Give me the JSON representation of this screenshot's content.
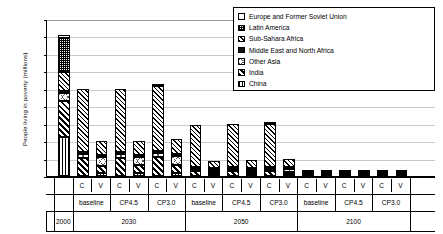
{
  "chart_data": {
    "type": "bar",
    "title": "",
    "subtitle": "",
    "xlabel": "",
    "ylabel": "People living in poverty (millions)",
    "ylim": [
      0,
      1800
    ],
    "ytick_step": 200,
    "yticks": [
      0,
      200,
      400,
      600,
      800,
      1000,
      1200,
      1400,
      1600,
      1800
    ],
    "grid": true,
    "stacked": true,
    "legend_position": "top-right",
    "legend": [
      "Europe and Former Soviet Union",
      "Latin America",
      "Sub-Sahara Africa",
      "Middle East and North Africa",
      "Other Asia",
      "India",
      "China"
    ],
    "series_order_bottom_to_top": [
      "China",
      "India",
      "Other Asia",
      "Middle East and North Africa",
      "Sub-Sahara Africa",
      "Latin America",
      "Europe and Former Soviet Union"
    ],
    "year_groups": [
      {
        "year": "2000",
        "scenarios": [
          {
            "name": "",
            "measures": [
              {
                "label": "",
                "total": 1620
              }
            ]
          }
        ]
      },
      {
        "year": "2030",
        "scenarios": [
          {
            "name": "baseline",
            "measures": [
              {
                "label": "C",
                "total": 1000
              },
              {
                "label": "V",
                "total": 400
              }
            ]
          },
          {
            "name": "CP4.5",
            "measures": [
              {
                "label": "C",
                "total": 1000
              },
              {
                "label": "V",
                "total": 405
              }
            ]
          },
          {
            "name": "CP3.0",
            "measures": [
              {
                "label": "C",
                "total": 1060
              },
              {
                "label": "V",
                "total": 420
              }
            ]
          }
        ]
      },
      {
        "year": "2050",
        "scenarios": [
          {
            "name": "baseline",
            "measures": [
              {
                "label": "C",
                "total": 590
              },
              {
                "label": "V",
                "total": 175
              }
            ]
          },
          {
            "name": "CP4.5",
            "measures": [
              {
                "label": "C",
                "total": 600
              },
              {
                "label": "V",
                "total": 180
              }
            ]
          },
          {
            "name": "CP3.0",
            "measures": [
              {
                "label": "C",
                "total": 625
              },
              {
                "label": "V",
                "total": 190
              }
            ]
          }
        ]
      },
      {
        "year": "2100",
        "scenarios": [
          {
            "name": "baseline",
            "measures": [
              {
                "label": "C",
                "total": 12
              },
              {
                "label": "V",
                "total": 58
              }
            ]
          },
          {
            "name": "CP4.5",
            "measures": [
              {
                "label": "C",
                "total": 12
              },
              {
                "label": "V",
                "total": 58
              }
            ]
          },
          {
            "name": "CP3.0",
            "measures": [
              {
                "label": "C",
                "total": 14
              },
              {
                "label": "V",
                "total": 60
              }
            ]
          }
        ]
      },
      {
        "year": "",
        "scenarios": []
      }
    ],
    "bars": [
      {
        "group": "2000",
        "scenario": "",
        "measure": "",
        "segments": [
          {
            "name": "China",
            "value": 450
          },
          {
            "name": "India",
            "value": 420
          },
          {
            "name": "Other Asia",
            "value": 95
          },
          {
            "name": "Middle East and North Africa",
            "value": 10
          },
          {
            "name": "Sub-Sahara Africa",
            "value": 215
          },
          {
            "name": "Latin America",
            "value": 390
          },
          {
            "name": "Europe and Former Soviet Union",
            "value": 40
          }
        ],
        "total": 1620
      },
      {
        "group": "2030",
        "scenario": "baseline",
        "measure": "C",
        "segments": [
          {
            "name": "China",
            "value": 0
          },
          {
            "name": "India",
            "value": 210
          },
          {
            "name": "Other Asia",
            "value": 45
          },
          {
            "name": "Middle East and North Africa",
            "value": 5
          },
          {
            "name": "Sub-Sahara Africa",
            "value": 740
          },
          {
            "name": "Latin America",
            "value": 0
          },
          {
            "name": "Europe and Former Soviet Union",
            "value": 0
          }
        ],
        "total": 1000
      },
      {
        "group": "2030",
        "scenario": "baseline",
        "measure": "V",
        "segments": [
          {
            "name": "China",
            "value": 35
          },
          {
            "name": "India",
            "value": 90
          },
          {
            "name": "Other Asia",
            "value": 100
          },
          {
            "name": "Middle East and North Africa",
            "value": 5
          },
          {
            "name": "Sub-Sahara Africa",
            "value": 170
          },
          {
            "name": "Latin America",
            "value": 0
          },
          {
            "name": "Europe and Former Soviet Union",
            "value": 0
          }
        ],
        "total": 400
      },
      {
        "group": "2030",
        "scenario": "CP4.5",
        "measure": "C",
        "segments": [
          {
            "name": "China",
            "value": 0
          },
          {
            "name": "India",
            "value": 210
          },
          {
            "name": "Other Asia",
            "value": 45
          },
          {
            "name": "Middle East and North Africa",
            "value": 5
          },
          {
            "name": "Sub-Sahara Africa",
            "value": 740
          },
          {
            "name": "Latin America",
            "value": 0
          },
          {
            "name": "Europe and Former Soviet Union",
            "value": 0
          }
        ],
        "total": 1000
      },
      {
        "group": "2030",
        "scenario": "CP4.5",
        "measure": "V",
        "segments": [
          {
            "name": "China",
            "value": 35
          },
          {
            "name": "India",
            "value": 92
          },
          {
            "name": "Other Asia",
            "value": 100
          },
          {
            "name": "Middle East and North Africa",
            "value": 5
          },
          {
            "name": "Sub-Sahara Africa",
            "value": 173
          },
          {
            "name": "Latin America",
            "value": 0
          },
          {
            "name": "Europe and Former Soviet Union",
            "value": 0
          }
        ],
        "total": 405
      },
      {
        "group": "2030",
        "scenario": "CP3.0",
        "measure": "C",
        "segments": [
          {
            "name": "China",
            "value": 0
          },
          {
            "name": "India",
            "value": 220
          },
          {
            "name": "Other Asia",
            "value": 48
          },
          {
            "name": "Middle East and North Africa",
            "value": 5
          },
          {
            "name": "Sub-Sahara Africa",
            "value": 757
          },
          {
            "name": "Latin America",
            "value": 30
          },
          {
            "name": "Europe and Former Soviet Union",
            "value": 0
          }
        ],
        "total": 1060
      },
      {
        "group": "2030",
        "scenario": "CP3.0",
        "measure": "V",
        "segments": [
          {
            "name": "China",
            "value": 38
          },
          {
            "name": "India",
            "value": 95
          },
          {
            "name": "Other Asia",
            "value": 105
          },
          {
            "name": "Middle East and North Africa",
            "value": 5
          },
          {
            "name": "Sub-Sahara Africa",
            "value": 177
          },
          {
            "name": "Latin America",
            "value": 0
          },
          {
            "name": "Europe and Former Soviet Union",
            "value": 0
          }
        ],
        "total": 420
      },
      {
        "group": "2050",
        "scenario": "baseline",
        "measure": "C",
        "segments": [
          {
            "name": "China",
            "value": 0
          },
          {
            "name": "India",
            "value": 60
          },
          {
            "name": "Other Asia",
            "value": 20
          },
          {
            "name": "Middle East and North Africa",
            "value": 3
          },
          {
            "name": "Sub-Sahara Africa",
            "value": 507
          },
          {
            "name": "Latin America",
            "value": 0
          },
          {
            "name": "Europe and Former Soviet Union",
            "value": 0
          }
        ],
        "total": 590
      },
      {
        "group": "2050",
        "scenario": "baseline",
        "measure": "V",
        "segments": [
          {
            "name": "China",
            "value": 8
          },
          {
            "name": "India",
            "value": 22
          },
          {
            "name": "Other Asia",
            "value": 30
          },
          {
            "name": "Middle East and North Africa",
            "value": 3
          },
          {
            "name": "Sub-Sahara Africa",
            "value": 112
          },
          {
            "name": "Latin America",
            "value": 0
          },
          {
            "name": "Europe and Former Soviet Union",
            "value": 0
          }
        ],
        "total": 175
      },
      {
        "group": "2050",
        "scenario": "CP4.5",
        "measure": "C",
        "segments": [
          {
            "name": "China",
            "value": 0
          },
          {
            "name": "India",
            "value": 62
          },
          {
            "name": "Other Asia",
            "value": 20
          },
          {
            "name": "Middle East and North Africa",
            "value": 3
          },
          {
            "name": "Sub-Sahara Africa",
            "value": 515
          },
          {
            "name": "Latin America",
            "value": 0
          },
          {
            "name": "Europe and Former Soviet Union",
            "value": 0
          }
        ],
        "total": 600
      },
      {
        "group": "2050",
        "scenario": "CP4.5",
        "measure": "V",
        "segments": [
          {
            "name": "China",
            "value": 8
          },
          {
            "name": "India",
            "value": 23
          },
          {
            "name": "Other Asia",
            "value": 31
          },
          {
            "name": "Middle East and North Africa",
            "value": 3
          },
          {
            "name": "Sub-Sahara Africa",
            "value": 115
          },
          {
            "name": "Latin America",
            "value": 0
          },
          {
            "name": "Europe and Former Soviet Union",
            "value": 0
          }
        ],
        "total": 180
      },
      {
        "group": "2050",
        "scenario": "CP3.0",
        "measure": "C",
        "segments": [
          {
            "name": "China",
            "value": 0
          },
          {
            "name": "India",
            "value": 65
          },
          {
            "name": "Other Asia",
            "value": 22
          },
          {
            "name": "Middle East and North Africa",
            "value": 3
          },
          {
            "name": "Sub-Sahara Africa",
            "value": 515
          },
          {
            "name": "Latin America",
            "value": 20
          },
          {
            "name": "Europe and Former Soviet Union",
            "value": 0
          }
        ],
        "total": 625
      },
      {
        "group": "2050",
        "scenario": "CP3.0",
        "measure": "V",
        "segments": [
          {
            "name": "China",
            "value": 8
          },
          {
            "name": "India",
            "value": 25
          },
          {
            "name": "Other Asia",
            "value": 33
          },
          {
            "name": "Middle East and North Africa",
            "value": 3
          },
          {
            "name": "Sub-Sahara Africa",
            "value": 121
          },
          {
            "name": "Latin America",
            "value": 0
          },
          {
            "name": "Europe and Former Soviet Union",
            "value": 0
          }
        ],
        "total": 190
      },
      {
        "group": "2100",
        "scenario": "baseline",
        "measure": "C",
        "segments": [
          {
            "name": "China",
            "value": 0
          },
          {
            "name": "India",
            "value": 2
          },
          {
            "name": "Other Asia",
            "value": 2
          },
          {
            "name": "Middle East and North Africa",
            "value": 0
          },
          {
            "name": "Sub-Sahara Africa",
            "value": 8
          },
          {
            "name": "Latin America",
            "value": 0
          },
          {
            "name": "Europe and Former Soviet Union",
            "value": 0
          }
        ],
        "total": 12
      },
      {
        "group": "2100",
        "scenario": "baseline",
        "measure": "V",
        "segments": [
          {
            "name": "China",
            "value": 0
          },
          {
            "name": "India",
            "value": 4
          },
          {
            "name": "Other Asia",
            "value": 4
          },
          {
            "name": "Middle East and North Africa",
            "value": 0
          },
          {
            "name": "Sub-Sahara Africa",
            "value": 50
          },
          {
            "name": "Latin America",
            "value": 0
          },
          {
            "name": "Europe and Former Soviet Union",
            "value": 0
          }
        ],
        "total": 58
      },
      {
        "group": "2100",
        "scenario": "CP4.5",
        "measure": "C",
        "segments": [
          {
            "name": "China",
            "value": 0
          },
          {
            "name": "India",
            "value": 2
          },
          {
            "name": "Other Asia",
            "value": 2
          },
          {
            "name": "Middle East and North Africa",
            "value": 0
          },
          {
            "name": "Sub-Sahara Africa",
            "value": 8
          },
          {
            "name": "Latin America",
            "value": 0
          },
          {
            "name": "Europe and Former Soviet Union",
            "value": 0
          }
        ],
        "total": 12
      },
      {
        "group": "2100",
        "scenario": "CP4.5",
        "measure": "V",
        "segments": [
          {
            "name": "China",
            "value": 0
          },
          {
            "name": "India",
            "value": 4
          },
          {
            "name": "Other Asia",
            "value": 4
          },
          {
            "name": "Middle East and North Africa",
            "value": 0
          },
          {
            "name": "Sub-Sahara Africa",
            "value": 50
          },
          {
            "name": "Latin America",
            "value": 0
          },
          {
            "name": "Europe and Former Soviet Union",
            "value": 0
          }
        ],
        "total": 58
      },
      {
        "group": "2100",
        "scenario": "CP3.0",
        "measure": "C",
        "segments": [
          {
            "name": "China",
            "value": 0
          },
          {
            "name": "India",
            "value": 3
          },
          {
            "name": "Other Asia",
            "value": 2
          },
          {
            "name": "Middle East and North Africa",
            "value": 0
          },
          {
            "name": "Sub-Sahara Africa",
            "value": 9
          },
          {
            "name": "Latin America",
            "value": 0
          },
          {
            "name": "Europe and Former Soviet Union",
            "value": 0
          }
        ],
        "total": 14
      },
      {
        "group": "2100",
        "scenario": "CP3.0",
        "measure": "V",
        "segments": [
          {
            "name": "China",
            "value": 0
          },
          {
            "name": "India",
            "value": 4
          },
          {
            "name": "Other Asia",
            "value": 4
          },
          {
            "name": "Middle East and North Africa",
            "value": 0
          },
          {
            "name": "Sub-Sahara Africa",
            "value": 52
          },
          {
            "name": "Latin America",
            "value": 0
          },
          {
            "name": "Europe and Former Soviet Union",
            "value": 0
          }
        ],
        "total": 60
      }
    ]
  },
  "colors": {
    "axis": "#000000",
    "gridline": "#c9c9c9",
    "background": "#ffffff"
  }
}
